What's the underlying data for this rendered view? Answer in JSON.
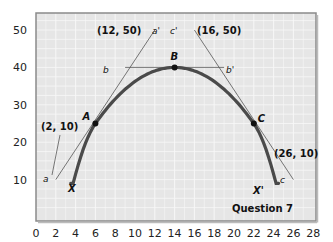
{
  "chart_data": {
    "type": "line",
    "title": "",
    "caption": "Question 7",
    "xlabel": "",
    "ylabel": "",
    "xlim": [
      0,
      28
    ],
    "ylim": [
      0,
      55
    ],
    "x_ticks": [
      "0",
      "2",
      "4",
      "6",
      "8",
      "10",
      "12",
      "14",
      "16",
      "18",
      "20",
      "22",
      "24",
      "26",
      "28"
    ],
    "y_ticks": [
      "10",
      "20",
      "30",
      "40",
      "50"
    ],
    "grid": true,
    "colors": {
      "plot_bg": "#e6e6e6",
      "grid": "#f7f7f7",
      "curve": "#4a4a4a",
      "frame": "#8a8a8a"
    },
    "series": [
      {
        "name": "XX' curve",
        "points": [
          [
            3.5,
            9
          ],
          [
            6,
            25
          ],
          [
            10,
            36
          ],
          [
            14,
            40
          ],
          [
            18,
            36
          ],
          [
            22,
            25
          ],
          [
            24.5,
            9
          ]
        ]
      },
      {
        "name": "tangent aa'",
        "points": [
          [
            2,
            10
          ],
          [
            12,
            50
          ]
        ]
      },
      {
        "name": "tangent bb'",
        "points": [
          [
            9,
            40
          ],
          [
            19,
            40
          ]
        ]
      },
      {
        "name": "tangent cc'",
        "points": [
          [
            16,
            50
          ],
          [
            26,
            10
          ]
        ]
      }
    ],
    "points": [
      {
        "label": "A",
        "x": 6,
        "y": 25
      },
      {
        "label": "B",
        "x": 14,
        "y": 40
      },
      {
        "label": "C",
        "x": 22,
        "y": 25
      }
    ],
    "annotations": [
      {
        "text": "(12, 50)",
        "x": 12,
        "y": 50
      },
      {
        "text": "(16, 50)",
        "x": 16,
        "y": 50
      },
      {
        "text": "(2, 10)",
        "x": 2,
        "y": 10
      },
      {
        "text": "(26, 10)",
        "x": 26,
        "y": 10
      },
      {
        "text": "a",
        "x": 2,
        "y": 10
      },
      {
        "text": "a'",
        "x": 12,
        "y": 50
      },
      {
        "text": "b",
        "x": 9,
        "y": 40
      },
      {
        "text": "b'",
        "x": 19,
        "y": 40
      },
      {
        "text": "c'",
        "x": 16,
        "y": 50
      },
      {
        "text": "c",
        "x": 26,
        "y": 10
      },
      {
        "text": "X",
        "x": 3.5,
        "y": 9
      },
      {
        "text": "X'",
        "x": 24.5,
        "y": 9
      }
    ]
  }
}
